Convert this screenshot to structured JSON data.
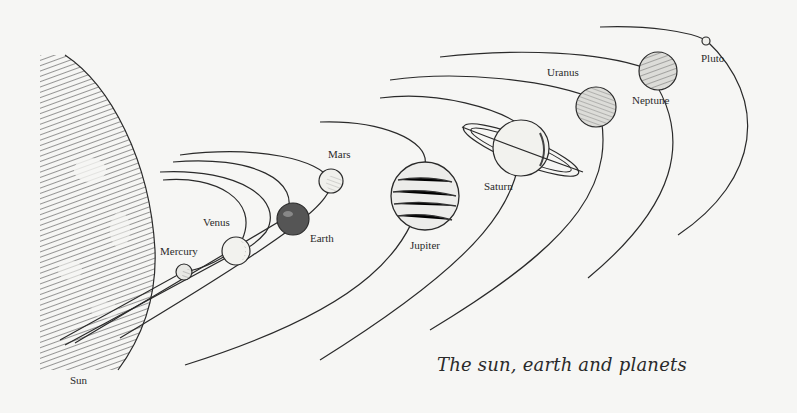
{
  "diagram": {
    "title": "The sun, earth and planets",
    "bodies": [
      {
        "id": "sun",
        "label": "Sun",
        "label_x": 70,
        "label_y": 374
      },
      {
        "id": "mercury",
        "label": "Mercury",
        "label_x": 160,
        "label_y": 245
      },
      {
        "id": "venus",
        "label": "Venus",
        "label_x": 203,
        "label_y": 216
      },
      {
        "id": "earth",
        "label": "Earth",
        "label_x": 310,
        "label_y": 232
      },
      {
        "id": "mars",
        "label": "Mars",
        "label_x": 328,
        "label_y": 148
      },
      {
        "id": "jupiter",
        "label": "Jupiter",
        "label_x": 410,
        "label_y": 239
      },
      {
        "id": "saturn",
        "label": "Saturn",
        "label_x": 484,
        "label_y": 180
      },
      {
        "id": "uranus",
        "label": "Uranus",
        "label_x": 547,
        "label_y": 66
      },
      {
        "id": "neptune",
        "label": "Neptune",
        "label_x": 632,
        "label_y": 94
      },
      {
        "id": "pluto",
        "label": "Pluto",
        "label_x": 701,
        "label_y": 52
      }
    ],
    "colors": {
      "ink": "#2a2a2a",
      "paper": "#f6f6f4"
    }
  }
}
